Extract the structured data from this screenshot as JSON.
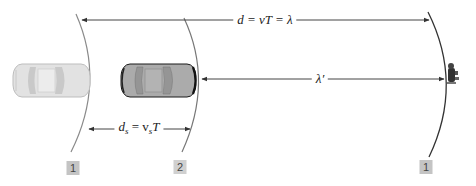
{
  "diagram": {
    "title": "",
    "labels": {
      "top_distance": "d = vT = λ",
      "middle_wavelength": "λ′",
      "source_distance_d": "d",
      "source_distance_sub": "s",
      "source_distance_eq": " = v",
      "source_distance_sub2": "s",
      "source_distance_T": "T"
    },
    "boxes": [
      {
        "text": "1",
        "position": "under left wavefront"
      },
      {
        "text": "2",
        "position": "under middle wavefront"
      },
      {
        "text": "1",
        "position": "under right wavefront"
      }
    ],
    "elements": {
      "source_car_earlier": "car at position 1 (faded)",
      "source_car_current": "car at position 2",
      "observer": "listener figure",
      "wavefronts": [
        "wavefront 1 (emitted at position 1)",
        "wavefront 2 (emitted at position 2)",
        "wavefront 1 (propagated)"
      ]
    },
    "colors": {
      "line": "#4a4a4a",
      "arc_light": "#8a8a8a",
      "arc_dark": "#333333",
      "car_light_body": "#dcdcdc",
      "car_dark_body": "#a9a9a9",
      "box_fill": "#c4c4c4"
    }
  }
}
